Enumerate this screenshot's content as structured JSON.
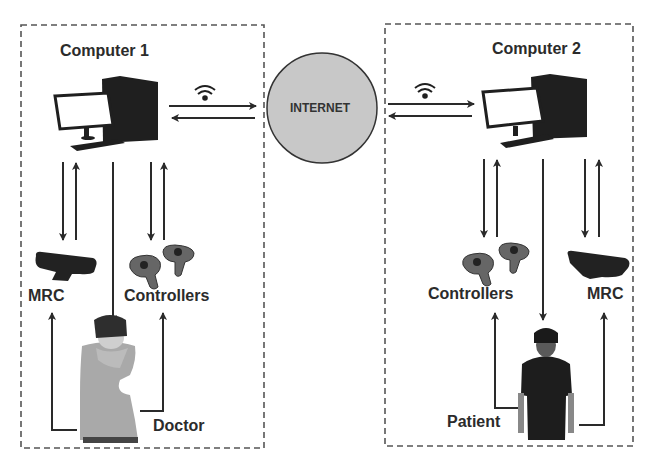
{
  "diagram": {
    "left_group": {
      "title": "Computer 1",
      "device_left": "MRC",
      "device_right": "Controllers",
      "person": "Doctor"
    },
    "right_group": {
      "title": "Computer 2",
      "device_left": "Controllers",
      "device_right": "MRC",
      "person": "Patient"
    },
    "network": {
      "label": "INTERNET"
    },
    "icons": [
      "desktop-computer-icon",
      "wifi-icon",
      "depth-camera-icon",
      "vr-controllers-icon",
      "vr-headset-person-icon"
    ],
    "colors": {
      "stroke": "#2a2a2a",
      "internet_fill": "#c8c8c8",
      "dashed_border": "#555555",
      "dark_device": "#1f1f1f"
    }
  }
}
